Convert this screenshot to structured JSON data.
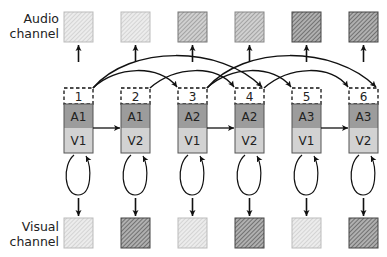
{
  "labels": {
    "audio_line1": "Audio",
    "audio_line2": "channel",
    "visual_line1": "Visual",
    "visual_line2": "channel"
  },
  "colors": {
    "a_row": "#9c9c9c",
    "v_row": "#d2d2d2",
    "shade_light": "#d8d8d8",
    "shade_medium": "#a8a8a8",
    "shade_dark": "#7c7c7c",
    "stroke": "#111111"
  },
  "columns": [
    {
      "number": "1",
      "audio": "A1",
      "visual": "V1",
      "audio_shade": "light",
      "visual_shade": "light"
    },
    {
      "number": "2",
      "audio": "A1",
      "visual": "V2",
      "audio_shade": "light",
      "visual_shade": "dark"
    },
    {
      "number": "3",
      "audio": "A2",
      "visual": "V1",
      "audio_shade": "medium",
      "visual_shade": "light"
    },
    {
      "number": "4",
      "audio": "A2",
      "visual": "V2",
      "audio_shade": "medium",
      "visual_shade": "dark"
    },
    {
      "number": "5",
      "audio": "A3",
      "visual": "V1",
      "audio_shade": "dark",
      "visual_shade": "light"
    },
    {
      "number": "6",
      "audio": "A3",
      "visual": "V2",
      "audio_shade": "dark",
      "visual_shade": "dark"
    }
  ],
  "transitions": {
    "arcs": [
      {
        "from": "1",
        "to": "3"
      },
      {
        "from": "1",
        "to": "4"
      },
      {
        "from": "2",
        "to": "4"
      },
      {
        "from": "3",
        "to": "5"
      },
      {
        "from": "3",
        "to": "6"
      },
      {
        "from": "4",
        "to": "6"
      }
    ],
    "straight": [
      {
        "from": "1",
        "to": "2"
      },
      {
        "from": "3",
        "to": "4"
      },
      {
        "from": "5",
        "to": "6"
      }
    ],
    "self_loops": [
      "1",
      "2",
      "3",
      "4",
      "5",
      "6"
    ]
  }
}
